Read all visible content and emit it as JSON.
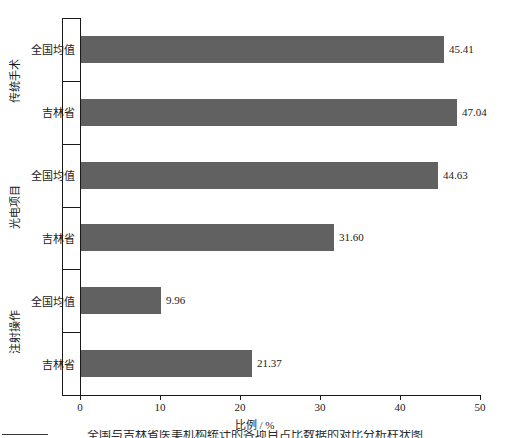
{
  "chart_data": {
    "type": "bar",
    "orientation": "horizontal",
    "title": "",
    "xlabel": "比例 / %",
    "ylabel": "",
    "xlim": [
      0,
      50
    ],
    "xticks": [
      0,
      10,
      20,
      30,
      40,
      50
    ],
    "xtick_labels": [
      "0",
      "10",
      "20",
      "30",
      "40",
      "50"
    ],
    "grid": false,
    "legend": false,
    "bar_color": "#616161",
    "axis_color": "#1a1a1a",
    "background_color": "#ffffff",
    "groups": [
      {
        "label": "传统手术",
        "bars": [
          {
            "category": "全国均值",
            "value": 45.41,
            "value_label": "45.41"
          },
          {
            "category": "吉林省",
            "value": 47.04,
            "value_label": "47.04"
          }
        ]
      },
      {
        "label": "光电项目",
        "bars": [
          {
            "category": "全国均值",
            "value": 44.63,
            "value_label": "44.63"
          },
          {
            "category": "吉林省",
            "value": 31.6,
            "value_label": "31.60"
          }
        ]
      },
      {
        "label": "注射操作",
        "bars": [
          {
            "category": "全国均值",
            "value": 9.96,
            "value_label": "9.96"
          },
          {
            "category": "吉林省",
            "value": 21.37,
            "value_label": "21.37"
          }
        ]
      }
    ],
    "categories": [
      "全国均值",
      "吉林省",
      "全国均值",
      "吉林省",
      "全国均值",
      "吉林省"
    ],
    "values": [
      45.41,
      47.04,
      44.63,
      31.6,
      9.96,
      21.37
    ]
  },
  "caption": {
    "text": "全国与吉林省医美机构统计的各项目占比数据的对比分析柱状图"
  }
}
